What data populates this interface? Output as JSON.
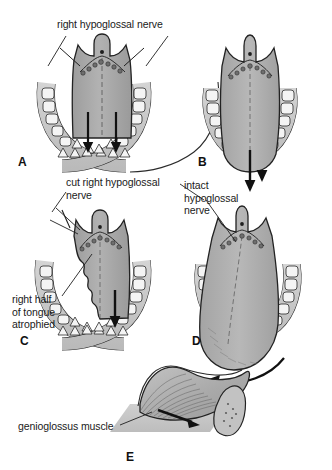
{
  "figure": {
    "type": "medical-illustration",
    "background_color": "#ffffff",
    "ink_color": "#1a1a1a",
    "tongue_fill": "#a8a8a8",
    "tongue_fill_dark": "#8f8f8f",
    "mandible_fill": "#c9c9c9",
    "tooth_fill": "#f2f2f2",
    "muscle_fill": "#b5b5b5"
  },
  "labels": {
    "right_hypoglossal_nerve": "right hypoglossal nerve",
    "cut_right_hypoglossal_nerve": "cut right hypoglossal\nnerve",
    "intact_hypoglossal_nerve": "intact\nhypoglossal\nnerve",
    "right_half_of_tongue_atrophied": "right half\nof tongue\natrophied",
    "genioglossus_muscle": "genioglossus muscle"
  },
  "panels": [
    {
      "id": "A",
      "letter": "A",
      "caption": "Normal tongue, bilateral hypoglossal nerve supply, symmetric protrusion"
    },
    {
      "id": "B",
      "letter": "B",
      "caption": "Normal tongue protrudes in midline"
    },
    {
      "id": "C",
      "letter": "C",
      "caption": "Cut right hypoglossal nerve, right half of tongue atrophied"
    },
    {
      "id": "D",
      "letter": "D",
      "caption": "Tongue deviates toward the lesioned side on protrusion"
    },
    {
      "id": "E",
      "letter": "E",
      "caption": "Genioglossus muscle pulls tongue forward"
    }
  ],
  "arrows": {
    "panel_a": "two downward arrows, balanced bilateral pull",
    "panel_b": "single downward midline arrow",
    "panel_c": "single downward arrow on intact side",
    "panel_d": "curved arrow showing deviation to the right",
    "panel_e": "straight arrow showing direction of genioglossus pull"
  }
}
